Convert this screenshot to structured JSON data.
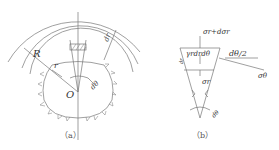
{
  "figure_a": {
    "caption": "（a）",
    "labels": {
      "outer_radius": "R",
      "inner_radius": "r",
      "ring_thickness": "dr",
      "center": "O",
      "angle": "dθ"
    }
  },
  "figure_b": {
    "caption": "（b）",
    "labels": {
      "top_stress": "σr+dσr",
      "body_force": "γrdrdθ",
      "bottom_stress": "σr",
      "half_angle": "dθ/2",
      "tangential_stress": "σθ",
      "angle": "dθ",
      "side_marker": "dr"
    }
  },
  "colors": {
    "line": "#666666",
    "text": "#333333",
    "background": "#ffffff"
  }
}
